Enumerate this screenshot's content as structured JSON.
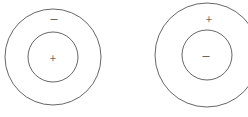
{
  "figure": {
    "background_color": "#ffffff",
    "stroke_color": "#555555",
    "label_color": "#3a3a3a",
    "width": 248,
    "height": 117
  },
  "diagrams": [
    {
      "id": "left-diagram",
      "name": "negative-shell-positive-core",
      "center": {
        "x": 53,
        "y": 57
      },
      "outer_circle": {
        "radius": 48
      },
      "inner_circle": {
        "radius": 25
      },
      "shell_label": {
        "text": "–",
        "x": 54,
        "y": 19,
        "icon": "minus-sign"
      },
      "core_label": {
        "text": "+",
        "x": 53,
        "y": 58,
        "icon": "plus-sign"
      }
    },
    {
      "id": "right-diagram",
      "name": "positive-shell-negative-core",
      "center": {
        "x": 207,
        "y": 55
      },
      "outer_circle": {
        "radius": 52
      },
      "inner_circle": {
        "radius": 25
      },
      "shell_label": {
        "text": "+",
        "x": 209,
        "y": 19,
        "icon": "plus-sign"
      },
      "core_label": {
        "text": "–",
        "x": 206,
        "y": 56,
        "icon": "minus-sign"
      }
    }
  ]
}
